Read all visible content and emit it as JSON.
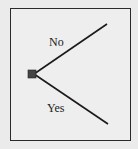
{
  "diagram": {
    "type": "decision-tree",
    "root": {
      "shape": "square",
      "color": "#444444"
    },
    "branches": [
      {
        "label": "No",
        "direction": "up"
      },
      {
        "label": "Yes",
        "direction": "down"
      }
    ],
    "colors": {
      "background": "#ebebeb",
      "frame_fill": "#eeeeee",
      "frame_border": "#2a2a2a",
      "line": "#1a1a1a",
      "text": "#222222"
    }
  }
}
